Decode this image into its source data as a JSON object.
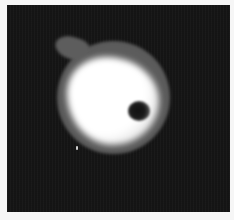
{
  "image": {
    "kind": "grayscale microscopy image",
    "subject": "bright rounded cell-like blob with a dark inclusion on the right side",
    "colors": {
      "background": "#151515",
      "border": "#f6f6f6",
      "halo": "#5a5a5a",
      "core": "#ffffff",
      "inclusion": "#111111"
    }
  }
}
